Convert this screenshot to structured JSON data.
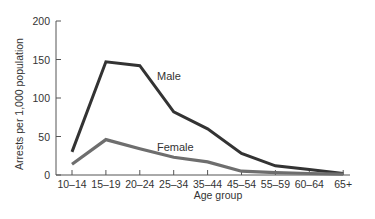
{
  "chart_data": {
    "type": "line",
    "title": "",
    "xlabel": "Age group",
    "ylabel": "Arrests per 1,000 population",
    "categories": [
      "10–14",
      "15–19",
      "20–24",
      "25–34",
      "35–44",
      "45–54",
      "55–59",
      "60–64",
      "65+"
    ],
    "series": [
      {
        "name": "Male",
        "color": "#333333",
        "values": [
          30,
          147,
          142,
          82,
          60,
          28,
          12,
          7,
          2
        ]
      },
      {
        "name": "Female",
        "color": "#6e6e6e",
        "values": [
          14,
          46,
          34,
          23,
          17,
          5,
          3,
          2,
          1
        ]
      }
    ],
    "yticks": [
      0,
      50,
      100,
      150,
      200
    ],
    "ylim": [
      0,
      200
    ],
    "grid": false,
    "legend": "inline labels"
  },
  "labels": {
    "male": "Male",
    "female": "Female",
    "xlabel": "Age group",
    "ylabel": "Arrests per 1,000 population"
  }
}
